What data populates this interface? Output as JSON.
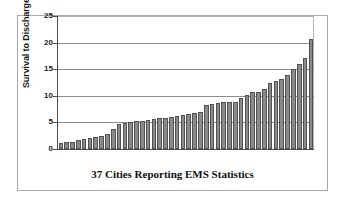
{
  "chart_data": {
    "type": "bar",
    "title": "",
    "xlabel": "37 Cities Reporting EMS Statistics",
    "ylabel": "Survival to Discharge (%)",
    "ylim": [
      0,
      25
    ],
    "yticks": [
      0,
      5,
      10,
      15,
      20,
      25
    ],
    "ytick_labels": [
      "0",
      "5",
      "10",
      "15",
      "20",
      "25"
    ],
    "grid": true,
    "legend": "none",
    "categories": [
      "City 1",
      "City 2",
      "City 3",
      "City 4",
      "City 5",
      "City 6",
      "City 7",
      "City 8",
      "City 9",
      "City 10",
      "City 11",
      "City 12",
      "City 13",
      "City 14",
      "City 15",
      "City 16",
      "City 17",
      "City 18",
      "City 19",
      "City 20",
      "City 21",
      "City 22",
      "City 23",
      "City 24",
      "City 25",
      "City 26",
      "City 27",
      "City 28",
      "City 29",
      "City 30",
      "City 31",
      "City 32",
      "City 33",
      "City 34",
      "City 35",
      "City 36",
      "City 37"
    ],
    "values": [
      1.2,
      1.3,
      1.3,
      1.7,
      1.8,
      2.0,
      2.2,
      2.4,
      2.9,
      3.7,
      4.7,
      4.8,
      5.1,
      5.2,
      5.3,
      5.4,
      5.6,
      5.8,
      5.9,
      6.0,
      6.2,
      6.4,
      6.6,
      6.7,
      7.0,
      8.3,
      8.5,
      8.6,
      8.8,
      8.9,
      8.9,
      9.5,
      10.1,
      10.7,
      10.8,
      11.3,
      12.5
    ],
    "values_extra": [
      12.8,
      13.1,
      13.9,
      15.1,
      16.0,
      17.2,
      20.7
    ],
    "max_value": 20.7,
    "min_value": 1.2,
    "bar_color": "#8a8a8a",
    "bar_edge_color": "#515151",
    "grid_color": "#8c8c8c",
    "axis_color": "#4d4d4d",
    "frame_color": "#a8a8a8",
    "background": "#ffffff"
  }
}
